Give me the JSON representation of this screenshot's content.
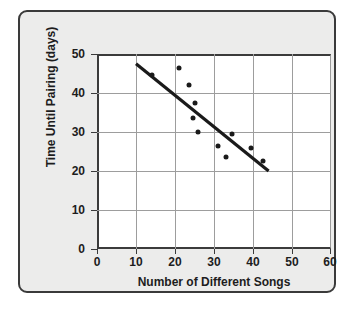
{
  "chart_data": {
    "type": "scatter",
    "title": "",
    "xlabel": "Number of Different Songs",
    "ylabel": "Time Until Pairing (days)",
    "xlim": [
      0,
      60
    ],
    "ylim": [
      0,
      50
    ],
    "xticks": [
      0,
      10,
      20,
      30,
      40,
      50,
      60
    ],
    "yticks": [
      0,
      10,
      20,
      30,
      40,
      50
    ],
    "xtick_labels": [
      "0",
      "10",
      "20",
      "30",
      "40",
      "50",
      "60"
    ],
    "ytick_labels": [
      "0",
      "10",
      "20",
      "30",
      "40",
      "50"
    ],
    "grid": true,
    "legend": null,
    "marker_color": "#1a1a1a",
    "line_color": "#1a1a1a",
    "points": [
      {
        "x": 14,
        "y": 44.5
      },
      {
        "x": 21,
        "y": 46.5
      },
      {
        "x": 23.5,
        "y": 42
      },
      {
        "x": 25,
        "y": 37.5
      },
      {
        "x": 24.5,
        "y": 33.5
      },
      {
        "x": 26,
        "y": 30
      },
      {
        "x": 31,
        "y": 26.5
      },
      {
        "x": 33,
        "y": 23.5
      },
      {
        "x": 34.5,
        "y": 29.5
      },
      {
        "x": 39.5,
        "y": 26
      },
      {
        "x": 42.5,
        "y": 22.5
      }
    ],
    "trend_line": {
      "x0": 10,
      "y0": 47.5,
      "x1": 44,
      "y1": 20
    }
  },
  "figure": {
    "background_color": "#ececeb",
    "plot_background_color": "#ffffff",
    "border_color": "#3a3a3a"
  }
}
